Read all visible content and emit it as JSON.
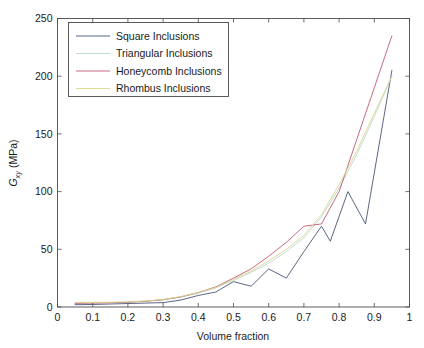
{
  "chart_data": {
    "type": "line",
    "title": "",
    "xlabel": "Volume fraction",
    "ylabel": "G_xy (MPa)",
    "ylabel_parts": {
      "main": "G",
      "sub": "xy",
      "unit": " (MPa)"
    },
    "xlim": [
      0,
      1
    ],
    "ylim": [
      0,
      250
    ],
    "xticks": [
      0,
      0.1,
      0.2,
      0.3,
      0.4,
      0.5,
      0.6,
      0.7,
      0.8,
      0.9,
      1
    ],
    "xticklabels": [
      "0",
      "0.1",
      "0.2",
      "0.3",
      "0.4",
      "0.5",
      "0.6",
      "0.7",
      "0.8",
      "0.9",
      "1"
    ],
    "yticks": [
      0,
      50,
      100,
      150,
      200,
      250
    ],
    "yticklabels": [
      "0",
      "50",
      "100",
      "150",
      "200",
      "250"
    ],
    "grid": false,
    "legend_position": "upper left",
    "series": [
      {
        "name": "Square Inclusions",
        "color": "#4a5578",
        "x": [
          0.05,
          0.1,
          0.15,
          0.2,
          0.25,
          0.3,
          0.35,
          0.4,
          0.45,
          0.5,
          0.55,
          0.6,
          0.65,
          0.7,
          0.75,
          0.775,
          0.825,
          0.875,
          0.95
        ],
        "values": [
          2.0,
          2.2,
          2.6,
          3.0,
          3.4,
          3.8,
          6.0,
          10.0,
          13.0,
          22.0,
          18.0,
          33.0,
          25.0,
          48.0,
          70.0,
          57.0,
          100.0,
          72.0,
          205.0
        ]
      },
      {
        "name": "Triangular Inclusions",
        "color": "#bcd6d6",
        "x": [
          0.05,
          0.1,
          0.15,
          0.2,
          0.25,
          0.3,
          0.35,
          0.4,
          0.45,
          0.5,
          0.55,
          0.6,
          0.65,
          0.7,
          0.75,
          0.8,
          0.85,
          0.9,
          0.95
        ],
        "values": [
          3.5,
          3.6,
          3.8,
          4.2,
          5.0,
          6.2,
          8.5,
          12.0,
          16.5,
          23.0,
          30.0,
          38.0,
          48.0,
          60.0,
          78.0,
          103.0,
          132.0,
          165.0,
          200.0
        ]
      },
      {
        "name": "Honeycomb Inclusions",
        "color": "#c05a72",
        "x": [
          0.05,
          0.1,
          0.15,
          0.2,
          0.25,
          0.3,
          0.35,
          0.4,
          0.45,
          0.5,
          0.55,
          0.6,
          0.65,
          0.7,
          0.75,
          0.8,
          0.85,
          0.9,
          0.95
        ],
        "values": [
          3.2,
          3.4,
          3.7,
          4.1,
          5.0,
          6.3,
          8.8,
          12.5,
          17.5,
          25.0,
          33.0,
          44.0,
          56.0,
          70.0,
          72.0,
          100.0,
          145.0,
          190.0,
          235.0
        ]
      },
      {
        "name": "Rhombus Inclusions",
        "color": "#d8d88a",
        "x": [
          0.05,
          0.1,
          0.15,
          0.2,
          0.25,
          0.3,
          0.35,
          0.4,
          0.45,
          0.5,
          0.55,
          0.6,
          0.65,
          0.7,
          0.75,
          0.8,
          0.85,
          0.9,
          0.95
        ],
        "values": [
          4.0,
          4.0,
          4.1,
          4.4,
          5.2,
          6.5,
          9.0,
          12.5,
          17.0,
          24.0,
          31.0,
          40.0,
          50.0,
          62.0,
          80.0,
          106.0,
          135.0,
          168.0,
          200.0
        ]
      }
    ]
  },
  "figure": {
    "background_color": "#ffffff",
    "axis_color": "#4a4a4a"
  }
}
